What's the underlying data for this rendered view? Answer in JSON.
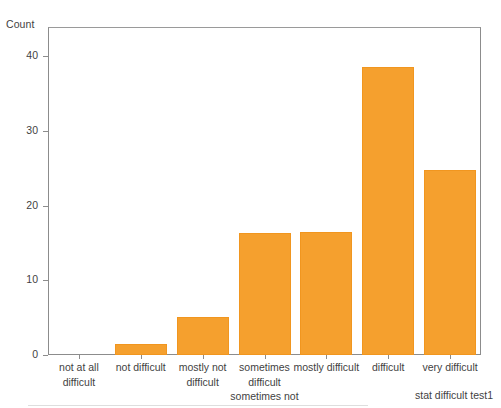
{
  "chart_data": {
    "type": "bar",
    "title": "",
    "subtitle": "",
    "xlabel": "stat difficult test1",
    "ylabel": "Count",
    "categories": [
      "not at all\ndifficult",
      "not difficult",
      "mostly not\ndifficult",
      "sometimes\ndifficult\nsometimes not",
      "mostly difficult",
      "difficult",
      "very difficult"
    ],
    "values": [
      0,
      1.5,
      5.1,
      16.3,
      16.4,
      38.6,
      24.7
    ],
    "ylim": [
      0,
      43.9
    ],
    "yticks": [
      0,
      10,
      20,
      30,
      40
    ],
    "ytick_labels": [
      "0",
      "10",
      "20",
      "30",
      "40"
    ],
    "grid": false,
    "legend": "none",
    "bar_color": "#f5a02e",
    "bar_edge_color": "#f1961f",
    "axis_color": "#8c8c8c",
    "text_color": "#3f3f3f",
    "background": "#ffffff"
  }
}
